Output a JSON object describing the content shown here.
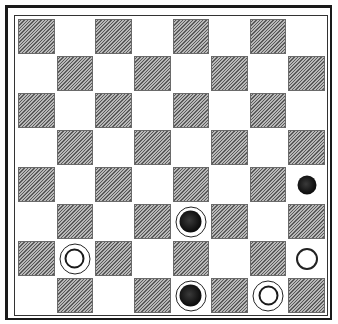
{
  "board": {
    "size": 8,
    "colors": {
      "light_square": "#ffffff",
      "dark_square": "#9a9a9a",
      "frame": "#1a1a1a"
    },
    "pieces": [
      {
        "row": 4,
        "col": 7,
        "color": "black",
        "type": "man"
      },
      {
        "row": 5,
        "col": 4,
        "color": "black",
        "type": "king"
      },
      {
        "row": 6,
        "col": 1,
        "color": "white",
        "type": "king"
      },
      {
        "row": 6,
        "col": 7,
        "color": "white",
        "type": "man"
      },
      {
        "row": 7,
        "col": 4,
        "color": "black",
        "type": "king"
      },
      {
        "row": 7,
        "col": 6,
        "color": "white",
        "type": "king"
      }
    ]
  }
}
